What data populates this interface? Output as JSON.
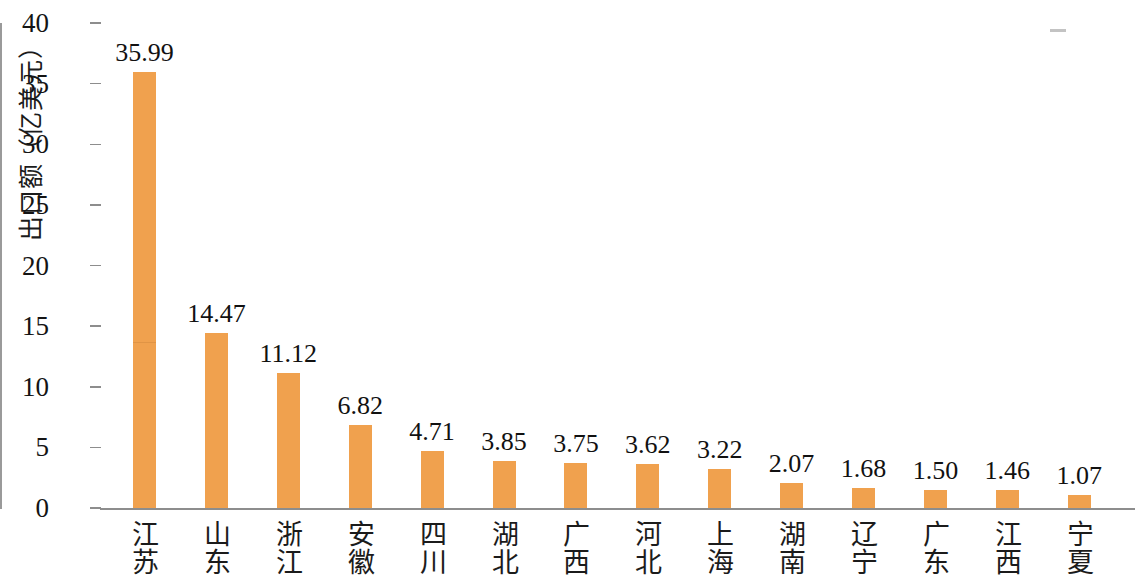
{
  "chart_data": {
    "type": "bar",
    "title": "",
    "xlabel": "",
    "ylabel": "出口额（亿美元）",
    "ylim": [
      0,
      40
    ],
    "ytick_labels": [
      "40",
      "35",
      "30",
      "25",
      "20",
      "15",
      "10",
      "5",
      "0"
    ],
    "ytick_values": [
      40,
      35,
      30,
      25,
      20,
      15,
      10,
      5,
      0
    ],
    "grid": false,
    "legend": "none",
    "bar_color": "#f0a14e",
    "axis_color": "#8d8d8d",
    "categories": [
      "江苏",
      "山东",
      "浙江",
      "安徽",
      "四川",
      "湖北",
      "广西",
      "河北",
      "上海",
      "湖南",
      "辽宁",
      "广东",
      "江西",
      "宁夏"
    ],
    "values": [
      35.99,
      14.47,
      11.12,
      6.82,
      4.71,
      3.85,
      3.75,
      3.62,
      3.22,
      2.07,
      1.68,
      1.5,
      1.46,
      1.07
    ],
    "value_labels": [
      "35.99",
      "14.47",
      "11.12",
      "6.82",
      "4.71",
      "3.85",
      "3.75",
      "3.62",
      "3.22",
      "2.07",
      "1.68",
      "1.50",
      "1.46",
      "1.07"
    ]
  }
}
